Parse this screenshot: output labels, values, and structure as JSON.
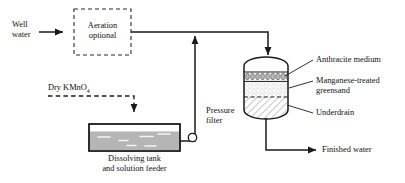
{
  "diagram": {
    "type": "process-flow",
    "title_visible": false,
    "colors": {
      "line": "#1a1a1a",
      "text": "#111111",
      "tank_liquid": "#b5b5b5",
      "greensand_fill": "#f2f2f2",
      "anthracite_bead": "#9a9a9a",
      "background": "#ffffff"
    }
  },
  "inputs": {
    "well_water_line1": "Well",
    "well_water_line2": "water",
    "dry_chemical_name": "Dry KMnO",
    "dry_chemical_subscript": "4"
  },
  "units": {
    "aeration_line1": "Aeration",
    "aeration_line2": "optional",
    "aeration_style": "dashed-box",
    "dissolving_tank_line1": "Dissolving tank",
    "dissolving_tank_line2": "and solution feeder",
    "pressure_filter_line1": "Pressure",
    "pressure_filter_line2": "filter"
  },
  "filter_media": [
    {
      "id": "anthracite",
      "label": "Anthracite medium",
      "label_line2": ""
    },
    {
      "id": "greensand",
      "label": "Manganese-treated",
      "label_line2": "greensand"
    },
    {
      "id": "underdrain",
      "label": "Underdrain",
      "label_line2": ""
    }
  ],
  "outputs": {
    "finished_water": "Finished water"
  },
  "equipment": {
    "pump_symbol": "circle",
    "feed_arrow_direction": "up"
  }
}
